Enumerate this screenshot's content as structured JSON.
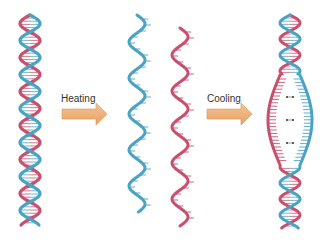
{
  "diagram": {
    "colors": {
      "strand_blue": "#4aa3c2",
      "strand_blue_dark": "#2c7a96",
      "strand_red": "#c7506e",
      "strand_red_dark": "#a03656",
      "arrow_fill": "#f0b07a",
      "arrow_stroke": "#d9935a",
      "hbond": "#333333"
    },
    "stages": [
      {
        "id": "double-helix",
        "description": "Intact double-stranded DNA"
      },
      {
        "id": "separated-strands",
        "description": "Two single strands after heating"
      },
      {
        "id": "partially-reannealed",
        "description": "Strands reannealing with hydrogen-bond gap"
      }
    ],
    "arrows": [
      {
        "label": "Heating"
      },
      {
        "label": "Cooling"
      }
    ]
  }
}
